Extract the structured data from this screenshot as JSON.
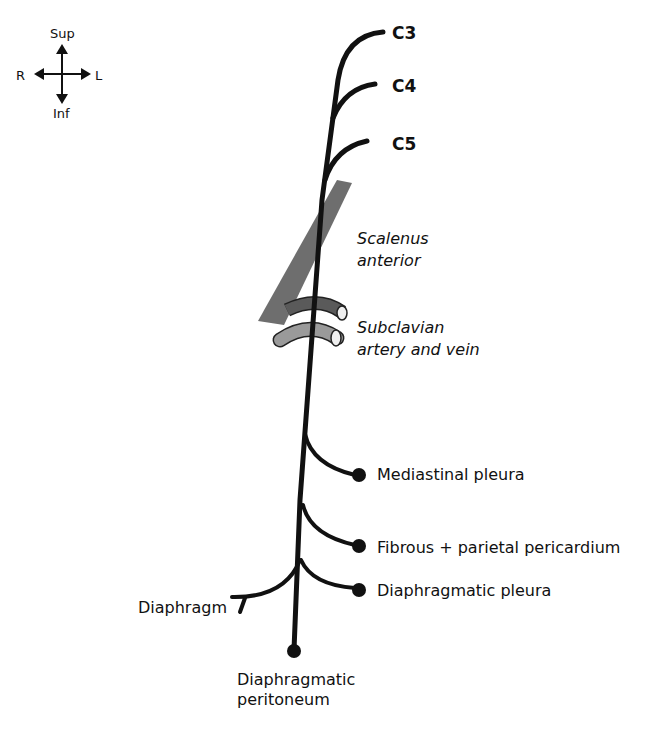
{
  "orientation": {
    "sup": "Sup",
    "inf": "Inf",
    "right": "R",
    "left": "L"
  },
  "roots": [
    {
      "label": "C3"
    },
    {
      "label": "C4"
    },
    {
      "label": "C5"
    }
  ],
  "structures": {
    "scalenus": {
      "line1": "Scalenus",
      "line2": "anterior",
      "color": "#6e6e6e"
    },
    "subclavian": {
      "line1": "Subclavian",
      "line2": "artery and vein",
      "artery_color": "#5a5a5a",
      "vein_color": "#9a9a9a"
    }
  },
  "branches": [
    {
      "label": "Mediastinal pleura"
    },
    {
      "label": "Fibrous + parietal pericardium"
    },
    {
      "label": "Diaphragmatic pleura"
    },
    {
      "label": "Diaphragm"
    },
    {
      "line1": "Diaphragmatic",
      "line2": "peritoneum"
    }
  ],
  "colors": {
    "nerve": "#111111",
    "background": "#ffffff"
  }
}
